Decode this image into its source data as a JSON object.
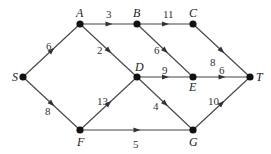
{
  "diagram": {
    "type": "directed-network",
    "nodes": [
      {
        "id": "S",
        "label": "S",
        "x": 23,
        "y": 77,
        "lx": 12,
        "ly": 81
      },
      {
        "id": "A",
        "label": "A",
        "x": 80,
        "y": 24,
        "lx": 76,
        "ly": 17
      },
      {
        "id": "B",
        "label": "B",
        "x": 137,
        "y": 24,
        "lx": 133,
        "ly": 17
      },
      {
        "id": "C",
        "label": "C",
        "x": 193,
        "y": 24,
        "lx": 189,
        "ly": 17
      },
      {
        "id": "D",
        "label": "D",
        "x": 137,
        "y": 77,
        "lx": 135,
        "ly": 71
      },
      {
        "id": "E",
        "label": "E",
        "x": 193,
        "y": 77,
        "lx": 189,
        "ly": 91
      },
      {
        "id": "T",
        "label": "T",
        "x": 250,
        "y": 77,
        "lx": 256,
        "ly": 81
      },
      {
        "id": "F",
        "label": "F",
        "x": 80,
        "y": 130,
        "lx": 77,
        "ly": 146
      },
      {
        "id": "G",
        "label": "G",
        "x": 193,
        "y": 130,
        "lx": 189,
        "ly": 146
      }
    ],
    "edges": [
      {
        "from": "S",
        "to": "A",
        "weight": "6",
        "lx": 46,
        "ly": 50
      },
      {
        "from": "S",
        "to": "F",
        "weight": "8",
        "lx": 45,
        "ly": 115
      },
      {
        "from": "A",
        "to": "B",
        "weight": "3",
        "lx": 106,
        "ly": 18
      },
      {
        "from": "A",
        "to": "D",
        "weight": "2",
        "lx": 97,
        "ly": 54
      },
      {
        "from": "B",
        "to": "C",
        "weight": "11",
        "lx": 163,
        "ly": 18
      },
      {
        "from": "B",
        "to": "E",
        "weight": "6",
        "lx": 154,
        "ly": 54
      },
      {
        "from": "C",
        "to": "T",
        "weight": "8",
        "lx": 210,
        "ly": 66
      },
      {
        "from": "D",
        "to": "E",
        "weight": "9",
        "lx": 162,
        "ly": 74
      },
      {
        "from": "E",
        "to": "T",
        "weight": "6",
        "lx": 219,
        "ly": 74
      },
      {
        "from": "D",
        "to": "G",
        "weight": "4",
        "lx": 153,
        "ly": 110
      },
      {
        "from": "F",
        "to": "D",
        "weight": "13",
        "lx": 97,
        "ly": 105
      },
      {
        "from": "F",
        "to": "G",
        "weight": "5",
        "lx": 133,
        "ly": 148
      },
      {
        "from": "G",
        "to": "T",
        "weight": "10",
        "lx": 208,
        "ly": 105
      }
    ]
  }
}
